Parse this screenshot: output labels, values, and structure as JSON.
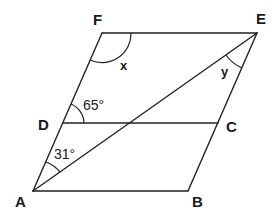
{
  "figure": {
    "vertices": {
      "A": "A",
      "B": "B",
      "C": "C",
      "D": "D",
      "E": "E",
      "F": "F"
    },
    "angles": {
      "angle_FDC": "65°",
      "angle_DAE": "31°",
      "angle_F": "x",
      "angle_AEB": "y"
    },
    "segments": [
      "AB",
      "BE",
      "EF",
      "FA",
      "DC",
      "AE"
    ],
    "colors": {
      "stroke": "#222222",
      "background": "#ffffff"
    }
  }
}
